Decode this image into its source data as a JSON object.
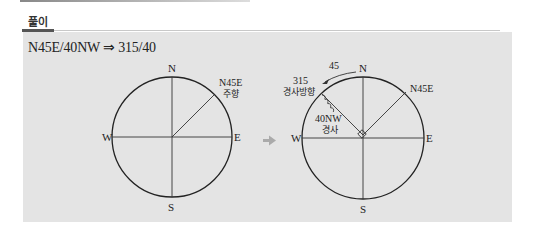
{
  "header": {
    "label": "풀이"
  },
  "formula": {
    "text": "N45E/40NW ⇒ 315/40"
  },
  "left_diagram": {
    "north": "N",
    "south": "S",
    "east": "E",
    "west": "W",
    "strike_label": "N45E",
    "strike_caption": "주향"
  },
  "transition_arrow": "⇒",
  "right_diagram": {
    "north": "N",
    "south": "S",
    "east": "E",
    "west": "W",
    "strike_label": "N45E",
    "rotation_value": "45",
    "dip_direction_value": "315",
    "dip_direction_caption": "경사방향",
    "dip_value": "40NW",
    "dip_caption": "경사"
  },
  "colors": {
    "panel_bg": "#e4e4e4",
    "line": "#222222",
    "arrow_gray": "#aaaaaa"
  }
}
